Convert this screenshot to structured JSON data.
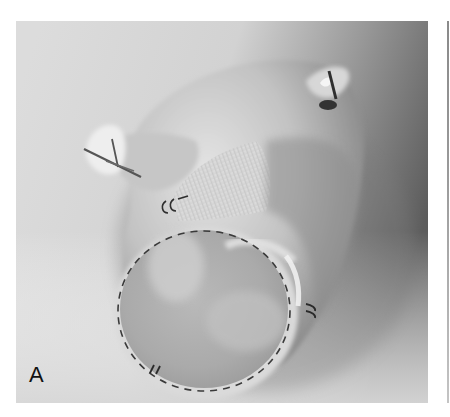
{
  "figure": {
    "panel_label": "A",
    "colors": {
      "background_light": "#d9d9d9",
      "background_dark": "#5f5f5f",
      "tissue_light": "#e6e6e6",
      "tissue_mid": "#b4b4b4",
      "suture": "#3a3a3a",
      "label": "#111111"
    }
  }
}
